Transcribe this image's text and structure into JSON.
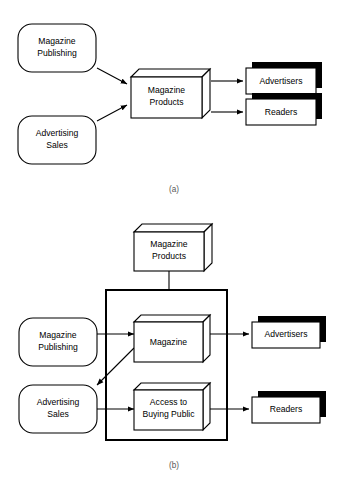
{
  "figure": {
    "background_color": "#ffffff",
    "line_color": "#000000",
    "shadow_color": "#000000",
    "node_fill": "#ffffff"
  },
  "panel_a": {
    "caption": "(a)",
    "inputs": [
      {
        "label_line1": "Magazine",
        "label_line2": "Publishing",
        "shape": "rounded-rectangle"
      },
      {
        "label_line1": "Advertising",
        "label_line2": "Sales",
        "shape": "rounded-rectangle"
      }
    ],
    "process": {
      "label_line1": "Magazine",
      "label_line2": "Products",
      "shape": "cube"
    },
    "outputs": [
      {
        "label": "Advertisers",
        "shape": "shadowed-rectangle"
      },
      {
        "label": "Readers",
        "shape": "shadowed-rectangle"
      }
    ]
  },
  "panel_b": {
    "caption": "(b)",
    "top_node": {
      "label_line1": "Magazine",
      "label_line2": "Products",
      "shape": "cube"
    },
    "inputs": [
      {
        "label_line1": "Magazine",
        "label_line2": "Publishing",
        "shape": "rounded-rectangle"
      },
      {
        "label_line1": "Advertising",
        "label_line2": "Sales",
        "shape": "rounded-rectangle"
      }
    ],
    "container": {
      "shape": "rectangle-outline"
    },
    "inner_nodes": [
      {
        "label_line1": "Magazine",
        "label_line2": "",
        "shape": "cube"
      },
      {
        "label_line1": "Access to",
        "label_line2": "Buying Public",
        "shape": "cube"
      }
    ],
    "outputs": [
      {
        "label": "Advertisers",
        "shape": "shadowed-rectangle"
      },
      {
        "label": "Readers",
        "shape": "shadowed-rectangle"
      }
    ]
  }
}
